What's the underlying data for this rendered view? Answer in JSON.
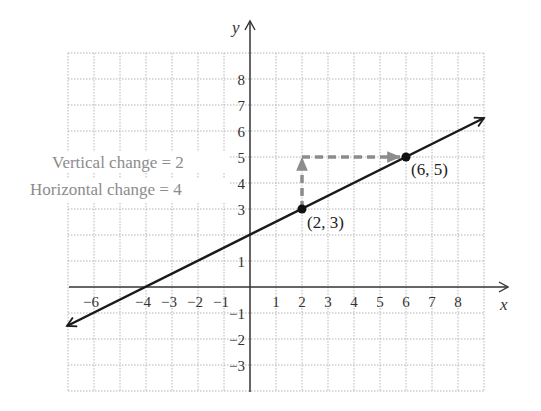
{
  "chart_data": {
    "type": "line",
    "title": "",
    "xlabel": "x",
    "ylabel": "y",
    "xlim": [
      -7,
      9
    ],
    "ylim": [
      -4,
      9
    ],
    "grid": true,
    "grid_style": "dotted",
    "x_ticks": [
      -6,
      -4,
      -3,
      -2,
      -1,
      1,
      2,
      3,
      4,
      5,
      6,
      7,
      8
    ],
    "x_tick_labels": [
      "−6",
      "−4",
      "−3",
      "−2",
      "−1",
      "1",
      "2",
      "3",
      "4",
      "5",
      "6",
      "7",
      "8"
    ],
    "y_ticks": [
      8,
      7,
      6,
      5,
      4,
      3,
      1,
      -1,
      -2,
      -3
    ],
    "y_tick_labels": [
      "8",
      "7",
      "6",
      "5",
      "4",
      "3",
      "1",
      "−1",
      "−2",
      "−3"
    ],
    "series": [
      {
        "name": "line",
        "slope": 0.5,
        "intercept": 2,
        "x": [
          -7,
          -4,
          0,
          2,
          6,
          9
        ],
        "y": [
          -1.5,
          0,
          2,
          3,
          5,
          6.5
        ],
        "arrows": "both",
        "color": "#1a1a1a"
      }
    ],
    "points": [
      {
        "x": 2,
        "y": 3,
        "label": "(2, 3)"
      },
      {
        "x": 6,
        "y": 5,
        "label": "(6, 5)"
      }
    ],
    "change_arrows": [
      {
        "kind": "vertical",
        "from": [
          2,
          3
        ],
        "to": [
          2,
          5
        ],
        "style": "dashed",
        "color": "#8c8c8c"
      },
      {
        "kind": "horizontal",
        "from": [
          2,
          5
        ],
        "to": [
          6,
          5
        ],
        "style": "dashed",
        "color": "#8c8c8c"
      }
    ],
    "annotations": [
      {
        "text": "Vertical change = 2",
        "color": "#8c8c8c"
      },
      {
        "text": "Horizontal change = 4",
        "color": "#8c8c8c"
      }
    ]
  },
  "labels": {
    "x_axis": "x",
    "y_axis": "y",
    "point_a": "(2, 3)",
    "point_b": "(6, 5)",
    "vertical_change": "Vertical change = 2",
    "horizontal_change": "Horizontal change = 4"
  },
  "ticks": {
    "x": [
      "−6",
      "−4",
      "−3",
      "−2",
      "−1",
      "1",
      "2",
      "3",
      "4",
      "5",
      "6",
      "7",
      "8"
    ],
    "y": [
      "8",
      "7",
      "6",
      "5",
      "4",
      "3",
      "1",
      "−1",
      "−2",
      "−3"
    ]
  },
  "colors": {
    "line": "#1a1a1a",
    "axis": "#333333",
    "grid": "#b5b5b5",
    "change_arrow": "#8c8c8c",
    "annotation_text": "#8c8c8c"
  }
}
